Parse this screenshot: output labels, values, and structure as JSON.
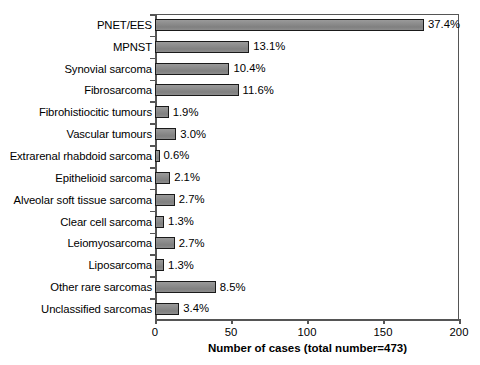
{
  "chart_data": {
    "type": "bar",
    "orientation": "horizontal",
    "title": "",
    "xlabel": "Number of cases (total number=473)",
    "ylabel": "",
    "xlim": [
      0,
      200
    ],
    "xticks": [
      0,
      50,
      100,
      150,
      200
    ],
    "grid": false,
    "legend": null,
    "total_cases": 473,
    "categories": [
      "PNET/EES",
      "MPNST",
      "Synovial sarcoma",
      "Fibrosarcoma",
      "Fibrohistiocitic tumours",
      "Vascular tumours",
      "Extrarenal rhabdoid sarcoma",
      "Epithelioid sarcoma",
      "Alveolar soft tissue sarcoma",
      "Clear cell sarcoma",
      "Leiomyosarcoma",
      "Liposarcoma",
      "Other rare sarcomas",
      "Unclassified sarcomas"
    ],
    "values": [
      177,
      62,
      49,
      55,
      9,
      14,
      3,
      10,
      13,
      6,
      13,
      6,
      40,
      16
    ],
    "percent_labels": [
      "37.4%",
      "13.1%",
      "10.4%",
      "11.6%",
      "1.9%",
      "3.0%",
      "0.6%",
      "2.1%",
      "2.7%",
      "1.3%",
      "2.7%",
      "1.3%",
      "8.5%",
      "3.4%"
    ],
    "percents": [
      37.4,
      13.1,
      10.4,
      11.6,
      1.9,
      3.0,
      0.6,
      2.1,
      2.7,
      1.3,
      2.7,
      1.3,
      8.5,
      3.4
    ],
    "colors": {
      "bar_fill": "#8a8a8a",
      "bar_edge": "#1a1a1a",
      "axis": "#555555",
      "text": "#000000",
      "background": "#ffffff"
    }
  }
}
